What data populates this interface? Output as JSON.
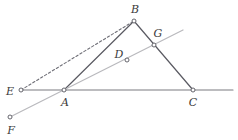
{
  "figure": {
    "kind": "geometry-diagram",
    "width": 238,
    "height": 140,
    "background": "#ffffff",
    "colors": {
      "dark_stroke": "#5a5a62",
      "light_stroke": "#b9b9bd",
      "dashed_stroke": "#6f6f77",
      "baseline_stroke": "#7a7a80",
      "label_text": "#3a3a3a",
      "point_fill": "#ffffff",
      "point_stroke": "#55555c"
    },
    "points": [
      {
        "id": "A",
        "label": "A",
        "x": 64,
        "y": 90,
        "label_x": 65,
        "label_y": 102
      },
      {
        "id": "B",
        "label": "B",
        "x": 134,
        "y": 21,
        "label_x": 135,
        "label_y": 9
      },
      {
        "id": "C",
        "label": "C",
        "x": 193,
        "y": 90,
        "label_x": 193,
        "label_y": 102
      },
      {
        "id": "D",
        "label": "D",
        "x": 127,
        "y": 60,
        "label_x": 119,
        "label_y": 54
      },
      {
        "id": "E",
        "label": "E",
        "x": 21,
        "y": 90,
        "label_x": 10,
        "label_y": 91
      },
      {
        "id": "F",
        "label": "F",
        "x": 10,
        "y": 117,
        "label_x": 11,
        "label_y": 130
      },
      {
        "id": "G",
        "label": "G",
        "x": 154,
        "y": 45,
        "label_x": 158,
        "label_y": 33
      }
    ],
    "segments": [
      {
        "id": "baseline-EC-extended",
        "name": "horizontal-baseline",
        "from": [
          21,
          90
        ],
        "to": [
          233,
          90
        ],
        "style": "solid",
        "color": "#7a7a80",
        "width": 1.1
      },
      {
        "id": "AB",
        "name": "segment-a-b",
        "from": [
          64,
          90
        ],
        "to": [
          134,
          21
        ],
        "style": "solid",
        "color": "#5a5a62",
        "width": 1.2
      },
      {
        "id": "BC",
        "name": "segment-b-c",
        "from": [
          134,
          21
        ],
        "to": [
          193,
          90
        ],
        "style": "solid",
        "color": "#5a5a62",
        "width": 1.2
      },
      {
        "id": "EB",
        "name": "segment-e-b-dashed",
        "from": [
          21,
          90
        ],
        "to": [
          134,
          21
        ],
        "style": "dashed",
        "color": "#6f6f77",
        "width": 1.1,
        "dash": "2.4 2.2"
      },
      {
        "id": "F-through-A-D-G",
        "name": "transversal-line-f-g",
        "from": [
          10,
          117
        ],
        "to": [
          183,
          30
        ],
        "style": "solid",
        "color": "#b9b9bd",
        "width": 1.2
      }
    ],
    "point_marker": {
      "radius": 2.0,
      "stroke_width": 0.9
    }
  }
}
